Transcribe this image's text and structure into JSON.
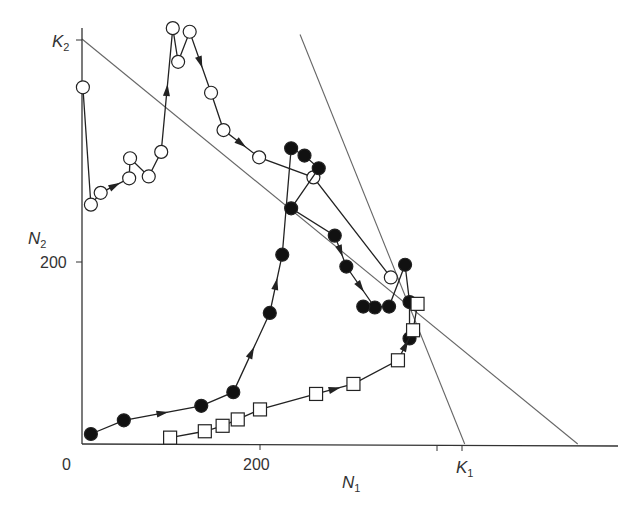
{
  "chart_data": {
    "type": "scatter",
    "title": "",
    "xlabel": "N1",
    "ylabel": "N2",
    "xlim": [
      0,
      620
    ],
    "ylim": [
      0,
      440
    ],
    "x_ticks": [
      {
        "value": 0,
        "label": "0"
      },
      {
        "value": 200,
        "label": "200"
      },
      {
        "value": 400,
        "label": ""
      },
      {
        "value": 430,
        "label": "K1"
      }
    ],
    "y_ticks": [
      {
        "value": 200,
        "label": "200"
      },
      {
        "value": 400,
        "label": ""
      },
      {
        "value": 445,
        "label": "K2"
      }
    ],
    "grid": false,
    "legend": null,
    "isoclines": [
      {
        "name": "species-2-isocline",
        "from": [
          0,
          445
        ],
        "to": [
          557,
          0
        ]
      },
      {
        "name": "species-1-isocline",
        "from": [
          245,
          450
        ],
        "to": [
          430,
          0
        ]
      }
    ],
    "series": [
      {
        "name": "open-circles",
        "marker": "open-circle",
        "points": [
          [
            1,
            392
          ],
          [
            10,
            263
          ],
          [
            21,
            276
          ],
          [
            53,
            292
          ],
          [
            54,
            314
          ],
          [
            75,
            294
          ],
          [
            89,
            321
          ],
          [
            102,
            457
          ],
          [
            108,
            420
          ],
          [
            121,
            453
          ],
          [
            145,
            386
          ],
          [
            159,
            345
          ],
          [
            199,
            315
          ],
          [
            260,
            293
          ],
          [
            347,
            183
          ]
        ],
        "arrows_after_index": [
          2,
          6,
          9,
          11
        ]
      },
      {
        "name": "filled-circles",
        "marker": "filled-circle",
        "points": [
          [
            10,
            11
          ],
          [
            47,
            26
          ],
          [
            134,
            42
          ],
          [
            170,
            57
          ],
          [
            211,
            144
          ],
          [
            225,
            208
          ],
          [
            235,
            325
          ],
          [
            250,
            317
          ],
          [
            266,
            303
          ],
          [
            235,
            259
          ],
          [
            284,
            229
          ],
          [
            297,
            195
          ],
          [
            329,
            150
          ],
          [
            316,
            151
          ],
          [
            345,
            151
          ],
          [
            363,
            197
          ],
          [
            368,
            156
          ],
          [
            368,
            116
          ]
        ],
        "arrows_after_index": [
          1,
          3,
          4,
          10,
          11,
          13
        ]
      },
      {
        "name": "open-squares",
        "marker": "open-square",
        "points": [
          [
            99,
            7
          ],
          [
            138,
            14
          ],
          [
            158,
            20
          ],
          [
            175,
            27
          ],
          [
            200,
            38
          ],
          [
            263,
            55
          ],
          [
            305,
            66
          ],
          [
            355,
            92
          ],
          [
            372,
            125
          ],
          [
            377,
            154
          ]
        ],
        "arrows_after_index": [
          5,
          7
        ]
      }
    ]
  },
  "axes": {
    "x_label": "N",
    "x_label_sub": "1",
    "y_label": "N",
    "y_label_sub": "2",
    "x_tick_0": "0",
    "x_tick_200": "200",
    "k1_label": "K",
    "k1_sub": "1",
    "y_tick_200": "200",
    "k2_label": "K",
    "k2_sub": "2"
  },
  "colors": {
    "axis": "#333333",
    "isocline": "#666666",
    "trajectory": "#222222",
    "marker_fill_filled": "#111111",
    "marker_fill_open": "#ffffff"
  }
}
